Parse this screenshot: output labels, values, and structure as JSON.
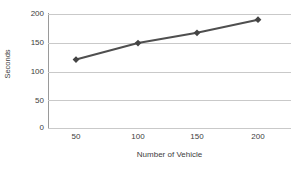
{
  "chart_data": {
    "type": "line",
    "title": "",
    "xlabel": "Number of Vehicle",
    "ylabel": "Seconds",
    "categories": [
      "50",
      "100",
      "150",
      "200"
    ],
    "x": [
      50,
      100,
      150,
      200
    ],
    "values": [
      120,
      149,
      167,
      190
    ],
    "series": [
      {
        "name": "Seconds",
        "values": [
          120,
          149,
          167,
          190
        ]
      }
    ],
    "ylim": [
      0,
      200
    ],
    "yticks": [
      "0",
      "50",
      "100",
      "150",
      "200"
    ],
    "ytick_values": [
      0,
      50,
      100,
      150,
      200
    ],
    "xticks": [
      "50",
      "100",
      "150",
      "200"
    ],
    "grid": "horizontal",
    "legend": "none",
    "marker": "diamond",
    "colors": {
      "series_line": "#4f4f4f",
      "marker": "#444444",
      "gridline": "#c9c9c9",
      "axis": "#9a9a9a",
      "text": "#3d3d3d",
      "background": "#ffffff"
    }
  }
}
